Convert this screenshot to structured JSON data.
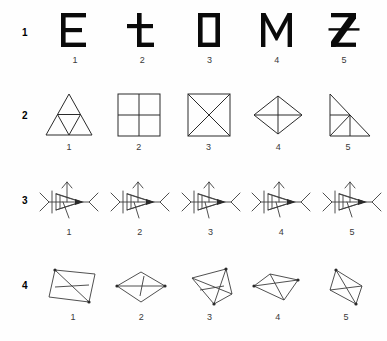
{
  "page": {
    "background_color": "#fefefe",
    "ink_color": "#2a2a2a",
    "width": 387,
    "height": 341
  },
  "rows": [
    {
      "label": "1",
      "kind": "letters",
      "items": [
        {
          "num": "1",
          "glyph": "E",
          "name": "letter-e"
        },
        {
          "num": "2",
          "glyph": "t",
          "name": "letter-t"
        },
        {
          "num": "3",
          "glyph": "D",
          "name": "letter-d-square"
        },
        {
          "num": "4",
          "glyph": "M",
          "name": "letter-m"
        },
        {
          "num": "5",
          "glyph": "Z",
          "name": "letter-z-struck"
        }
      ]
    },
    {
      "label": "2",
      "kind": "polygons",
      "items": [
        {
          "num": "1",
          "name": "subdivided-triangle"
        },
        {
          "num": "2",
          "name": "quartered-square"
        },
        {
          "num": "3",
          "name": "square-with-x"
        },
        {
          "num": "4",
          "name": "diamond-with-cross"
        },
        {
          "num": "5",
          "name": "right-triangle-subdivided"
        }
      ]
    },
    {
      "label": "3",
      "kind": "arrow-figures",
      "items": [
        {
          "num": "1",
          "name": "arrow-figure-1"
        },
        {
          "num": "2",
          "name": "arrow-figure-2"
        },
        {
          "num": "3",
          "name": "arrow-figure-3"
        },
        {
          "num": "4",
          "name": "arrow-figure-4"
        },
        {
          "num": "5",
          "name": "arrow-figure-5"
        }
      ]
    },
    {
      "label": "4",
      "kind": "rhombi",
      "items": [
        {
          "num": "1",
          "name": "parallelogram-1"
        },
        {
          "num": "2",
          "name": "rhombus-2"
        },
        {
          "num": "3",
          "name": "rhombus-3"
        },
        {
          "num": "4",
          "name": "rhombus-4"
        },
        {
          "num": "5",
          "name": "rhombus-5"
        }
      ]
    }
  ]
}
